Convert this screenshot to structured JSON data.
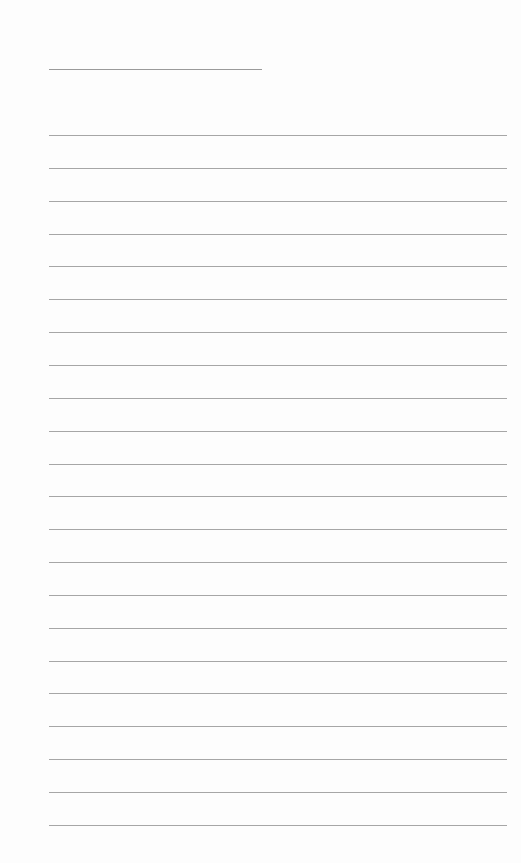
{
  "page": {
    "type": "lined-paper",
    "title_line": {
      "label": ""
    },
    "rules": {
      "count": 22,
      "first_y": 135,
      "spacing": 32.85,
      "left": 49,
      "width": 458
    },
    "line_color": "#a6a6a6",
    "background": "#fdfdfd"
  }
}
